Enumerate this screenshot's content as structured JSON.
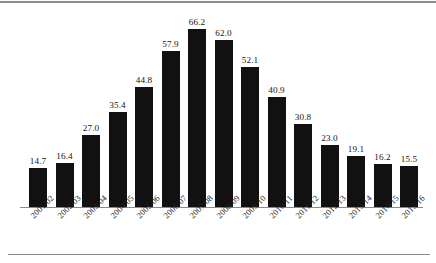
{
  "chart_data": {
    "type": "bar",
    "title": "",
    "subtitle": "",
    "xlabel": "",
    "ylabel": "",
    "ylim": [
      0,
      70
    ],
    "grid": false,
    "legend": null,
    "bar_color": "#111111",
    "axis_color": "#8a8a8a",
    "rule_color": "#8c8c8c",
    "label_rotation_deg": -45,
    "categories": [
      "2001/02",
      "2002/03",
      "2003/04",
      "2004/05",
      "2005/06",
      "2006/07",
      "2007/08",
      "2008/09",
      "2009/10",
      "2010/11",
      "2011/12",
      "2012/13",
      "2013/14",
      "2014/15",
      "2015/16"
    ],
    "values": [
      14.7,
      16.4,
      27.0,
      35.4,
      44.8,
      57.9,
      66.2,
      62.0,
      52.1,
      40.9,
      30.8,
      23.0,
      19.1,
      16.2,
      15.5
    ],
    "value_labels": [
      "14.7",
      "16.4",
      "27.0",
      "35.4",
      "44.8",
      "57.9",
      "66.2",
      "62.0",
      "52.1",
      "40.9",
      "30.8",
      "23.0",
      "19.1",
      "16.2",
      "15.5"
    ]
  }
}
